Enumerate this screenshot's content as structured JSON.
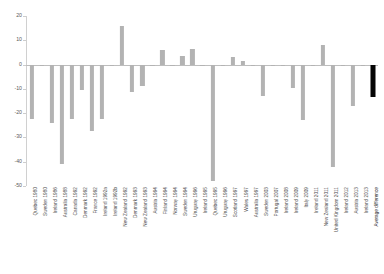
{
  "chart_data": {
    "type": "bar",
    "title": "",
    "subtitle": "",
    "xlabel": "",
    "ylabel": "",
    "ylim": [
      -50,
      20
    ],
    "yticks": [
      20,
      10,
      0,
      -10,
      -20,
      -30,
      -40,
      -50
    ],
    "ytick_labels": [
      "20",
      "10",
      "0",
      "-10",
      "-20",
      "-30",
      "-40",
      "-50"
    ],
    "grid": false,
    "legend": null,
    "bar_color": "#b3b3b3",
    "highlight_color": "#000000",
    "highlight_category": "Average difference",
    "categories": [
      "Quebec 1980",
      "Sweden 1980",
      "Ireland 1986",
      "Australia 1988",
      "Canada 1992",
      "Denmark 1992",
      "France 1992",
      "Ireland 1992a",
      "Ireland 1992b",
      "New Zealand 1992",
      "Denmark 1993",
      "New Zealand 1993",
      "Austria 1994",
      "Finland 1994",
      "Norway 1994",
      "Sweden 1994",
      "Uruguay 1996",
      "Ireland 1995",
      "Quebec 1995",
      "Uruguay 1996",
      "Scotland 1997",
      "Wales 1997",
      "Australia 1997",
      "Sweden 2003",
      "Portugal 2007",
      "Ireland 2008",
      "Ireland 2009",
      "Italy 2009",
      "Ireland 2011",
      "New Zealand 2011",
      "United Kingdom 2011",
      "Ireland 2012",
      "Austria 2013",
      "Ireland 2013",
      "Average difference"
    ],
    "values": [
      -22.5,
      -0.6,
      -24.0,
      -41.0,
      -22.5,
      -10.5,
      -27.5,
      -22.5,
      -0.4,
      16.0,
      -11.5,
      -9.0,
      -0.5,
      6.0,
      -0.4,
      3.5,
      6.5,
      -0.5,
      -48.0,
      -0.4,
      3.0,
      1.5,
      -0.6,
      -13.0,
      -0.5,
      -0.7,
      -9.5,
      -23.0,
      -0.5,
      8.0,
      -42.0,
      -0.6,
      -17.0,
      -0.5,
      -13.5
    ]
  }
}
